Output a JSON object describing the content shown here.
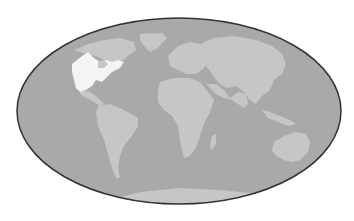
{
  "map": {
    "projection": "mollweide-style world map",
    "colors": {
      "ocean": "#a9a9a9",
      "land": "#c6c6c6",
      "highlight": "#f4f4f4",
      "border": "#333333",
      "background": "#ffffff"
    },
    "highlighted_region": "United States",
    "regions": [
      {
        "name": "North America",
        "highlighted": false
      },
      {
        "name": "United States",
        "highlighted": true
      },
      {
        "name": "Greenland",
        "highlighted": false
      },
      {
        "name": "South America",
        "highlighted": false
      },
      {
        "name": "Europe",
        "highlighted": false
      },
      {
        "name": "Africa",
        "highlighted": false
      },
      {
        "name": "Asia",
        "highlighted": false
      },
      {
        "name": "Australia",
        "highlighted": false
      },
      {
        "name": "Antarctica",
        "highlighted": false
      }
    ]
  }
}
